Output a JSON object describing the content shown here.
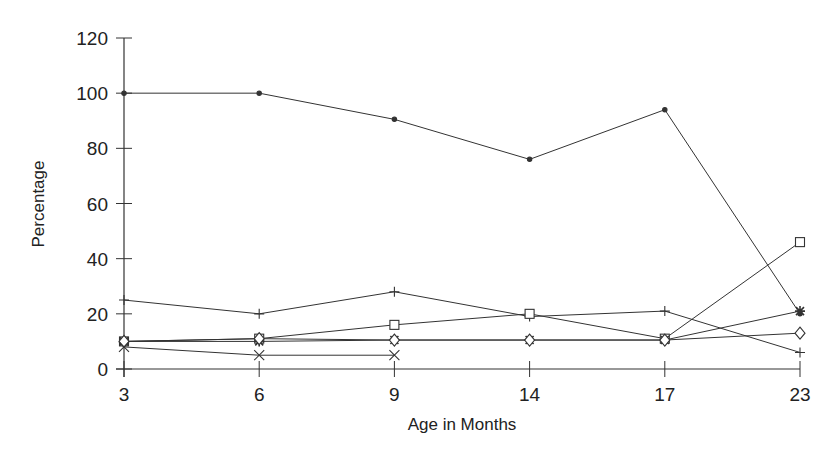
{
  "chart_data": {
    "type": "line",
    "title": "",
    "xlabel": "Age in Months",
    "ylabel": "Percentage",
    "categories": [
      "3",
      "6",
      "9",
      "14",
      "17",
      "23"
    ],
    "ylim": [
      0,
      120
    ],
    "yticks": [
      0,
      20,
      40,
      60,
      80,
      100,
      120
    ],
    "grid": false,
    "legend": null,
    "series": [
      {
        "name": "dot",
        "marker": "dot",
        "values": [
          100,
          100,
          90.5,
          76,
          94,
          20
        ]
      },
      {
        "name": "plus",
        "marker": "plus",
        "values": [
          25,
          20,
          28,
          19,
          21,
          6
        ]
      },
      {
        "name": "square",
        "marker": "square",
        "values": [
          10,
          11,
          16,
          20,
          11,
          46
        ]
      },
      {
        "name": "star",
        "marker": "star",
        "values": [
          10,
          10,
          10.5,
          10.5,
          10.5,
          21
        ]
      },
      {
        "name": "diamond",
        "marker": "diamond",
        "values": [
          10,
          11,
          10.5,
          10.5,
          10.5,
          13
        ]
      },
      {
        "name": "cross",
        "marker": "cross",
        "values": [
          8,
          5,
          5,
          null,
          null,
          null
        ]
      }
    ]
  },
  "colors": {
    "line": "#333333",
    "text": "#222222",
    "background": "#ffffff"
  }
}
